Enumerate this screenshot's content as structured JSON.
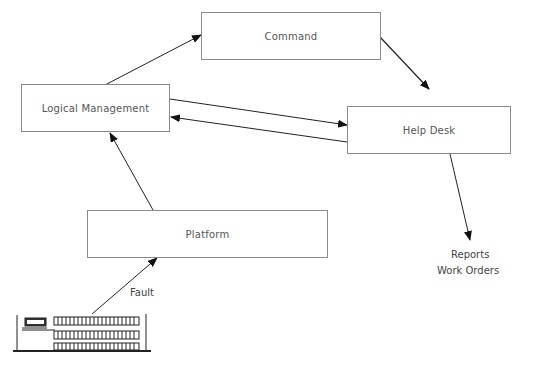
{
  "nodes": {
    "command": {
      "label": "Command"
    },
    "logical_management": {
      "label": "Logical Management"
    },
    "help_desk": {
      "label": "Help Desk"
    },
    "platform": {
      "label": "Platform"
    }
  },
  "edges": [
    {
      "from": "logical_management",
      "to": "command"
    },
    {
      "from": "command",
      "to": "help_desk"
    },
    {
      "from": "logical_management",
      "to": "help_desk"
    },
    {
      "from": "help_desk",
      "to": "logical_management"
    },
    {
      "from": "platform",
      "to": "logical_management"
    },
    {
      "from": "building",
      "to": "platform",
      "label": "Fault",
      "style": "dashed"
    },
    {
      "from": "help_desk",
      "to": "outputs"
    }
  ],
  "labels": {
    "fault": "Fault",
    "reports": "Reports",
    "work_orders": "Work Orders"
  },
  "colors": {
    "line": "#222222",
    "box_border": "#8a8a8a",
    "text": "#555555"
  }
}
